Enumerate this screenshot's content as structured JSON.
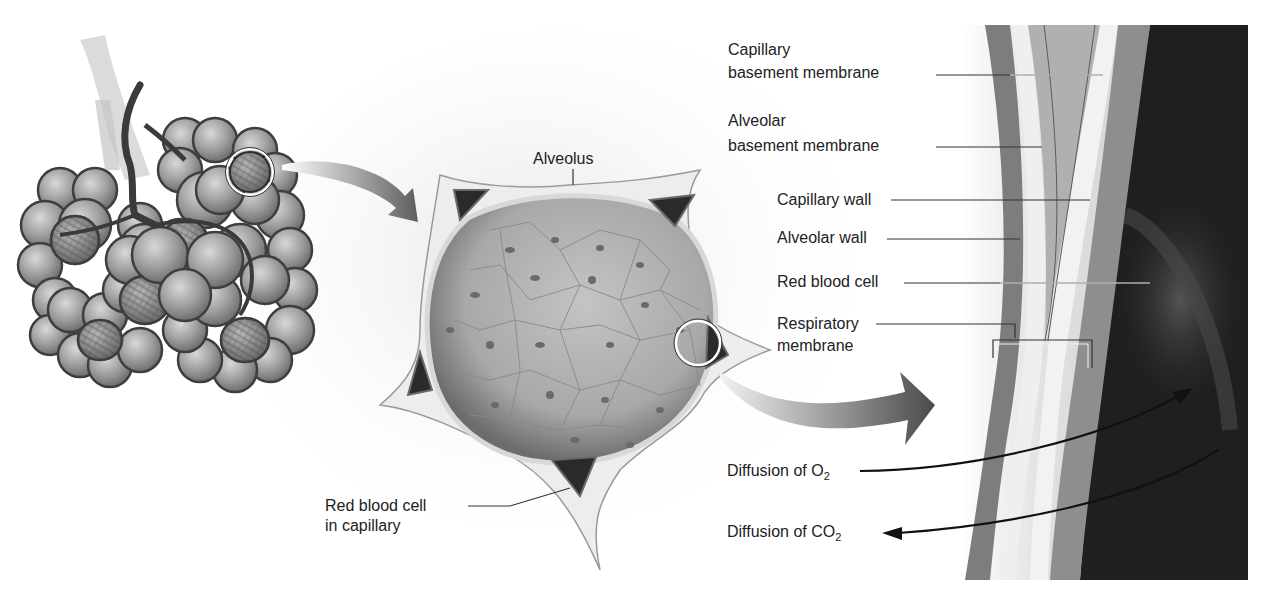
{
  "figure": {
    "panels": [
      {
        "id": "alveolar-sac",
        "description": "Cluster of alveoli with branching bronchiole and capillary networks"
      },
      {
        "id": "alveolus-section",
        "description": "Cross-section of single alveolus surrounded by capillaries"
      },
      {
        "id": "respiratory-membrane",
        "description": "Magnified view of respiratory membrane layers"
      }
    ],
    "labels": {
      "alveolus": "Alveolus",
      "rbc_capillary_line1": "Red blood cell",
      "rbc_capillary_line2": "in capillary",
      "capillary_bm_line1": "Capillary",
      "capillary_bm_line2": "basement membrane",
      "alveolar_bm_line1": "Alveolar",
      "alveolar_bm_line2": "basement membrane",
      "capillary_wall": "Capillary wall",
      "alveolar_wall": "Alveolar wall",
      "red_blood_cell": "Red blood cell",
      "resp_membrane_line1": "Respiratory",
      "resp_membrane_line2": "membrane",
      "diffusion_o2_prefix": "Diffusion of O",
      "diffusion_o2_sub": "2",
      "diffusion_co2_prefix": "Diffusion of CO",
      "diffusion_co2_sub": "2"
    },
    "colors": {
      "background": "#ffffff",
      "alveoli_fill": "#9a9a9a",
      "alveoli_outline": "#4a4a4a",
      "capillary_dark": "#2a2a2a",
      "membrane_mid": "#8c8c8c",
      "membrane_light": "#e6e6e6",
      "blood_dark": "#1e1e1e",
      "arrow_gray": "#6a6a6a",
      "text": "#222222"
    }
  }
}
